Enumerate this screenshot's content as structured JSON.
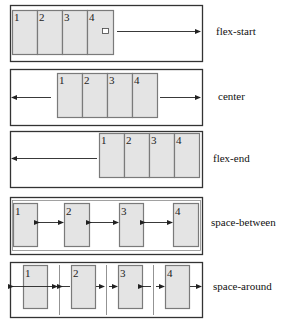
{
  "diagram": {
    "rows": [
      {
        "id": "flex-start",
        "label": "flex-start",
        "items": [
          "1",
          "2",
          "3",
          "4"
        ],
        "free_space": "end"
      },
      {
        "id": "center",
        "label": "center",
        "items": [
          "1",
          "2",
          "3",
          "4"
        ],
        "free_space": "both-sides"
      },
      {
        "id": "flex-end",
        "label": "flex-end",
        "items": [
          "1",
          "2",
          "3",
          "4"
        ],
        "free_space": "start"
      },
      {
        "id": "space-between",
        "label": "space-between",
        "items": [
          "1",
          "2",
          "3",
          "4"
        ],
        "free_space": "between-items"
      },
      {
        "id": "space-around",
        "label": "space-around",
        "items": [
          "1",
          "2",
          "3",
          "4"
        ],
        "free_space": "around-items"
      }
    ]
  }
}
